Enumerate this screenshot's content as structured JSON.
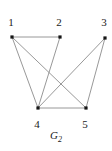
{
  "figure": {
    "caption_base": "G",
    "caption_subscript": "2",
    "background_color": "#ffffff",
    "edge_color": "#8c8c8c",
    "vertex_color": "#151515",
    "label_color": "#1a1a1a"
  },
  "chart_data": {
    "type": "diagram",
    "title": "G2",
    "graph_kind": "undirected-simple-graph",
    "vertex_count": 5,
    "edge_count": 7,
    "vertices": [
      {
        "id": "1",
        "label": "1",
        "x": 12,
        "y": 37,
        "label_x": 11,
        "label_y": 22
      },
      {
        "id": "2",
        "label": "2",
        "x": 60,
        "y": 37,
        "label_x": 59,
        "label_y": 22
      },
      {
        "id": "3",
        "label": "3",
        "x": 105,
        "y": 38,
        "label_x": 104,
        "label_y": 22
      },
      {
        "id": "4",
        "label": "4",
        "x": 38,
        "y": 108,
        "label_x": 37,
        "label_y": 124
      },
      {
        "id": "5",
        "label": "5",
        "x": 86,
        "y": 108,
        "label_x": 85,
        "label_y": 124
      }
    ],
    "edges": [
      {
        "from": "1",
        "to": "2"
      },
      {
        "from": "1",
        "to": "4"
      },
      {
        "from": "1",
        "to": "5"
      },
      {
        "from": "2",
        "to": "4"
      },
      {
        "from": "3",
        "to": "4"
      },
      {
        "from": "3",
        "to": "5"
      },
      {
        "from": "4",
        "to": "5"
      }
    ]
  }
}
